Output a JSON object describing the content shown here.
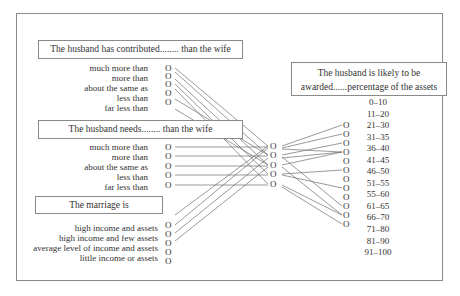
{
  "diagram": {
    "questions": [
      {
        "prompt": "The husband has contributed........ than the wife",
        "options": [
          "much more than",
          "more than",
          "about the same as",
          "less than",
          "far less than"
        ]
      },
      {
        "prompt": "The husband needs........ than the wife",
        "options": [
          "much more than",
          "more than",
          "about the same as",
          "less than",
          "far less than"
        ]
      },
      {
        "prompt": "The marriage is",
        "options": [
          "high income and assets",
          "high income and few assets",
          "average level of income and assets",
          "little income or assets"
        ]
      }
    ],
    "output": {
      "prompt_line1": "The husband is likely to be",
      "prompt_line2": "awarded......percentage of the assets",
      "ranges": [
        "0–10",
        "11–20",
        "21–30",
        "31–35",
        "36–40",
        "41–45",
        "46–50",
        "51–55",
        "55–60",
        "61–65",
        "66–70",
        "71–80",
        "81–90",
        "91–100"
      ]
    },
    "node_glyph": "O",
    "hidden_node_count": 5,
    "output_node_count": 12,
    "line_color": "#6e6e6e",
    "border_color": "#8a8a8a"
  }
}
